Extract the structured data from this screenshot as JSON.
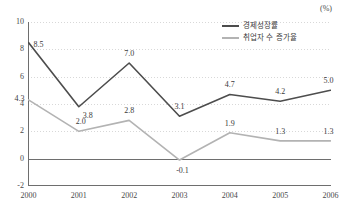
{
  "unit_label": "(%)",
  "legend": {
    "position": "top-right",
    "items": [
      {
        "label": "경제성장률",
        "color": "#4d4d4d"
      },
      {
        "label": "취업자 수 증가율",
        "color": "#b3b3b3"
      }
    ]
  },
  "chart_data": {
    "type": "line",
    "title": "",
    "subtitle": "",
    "xlabel": "",
    "ylabel": "",
    "unit": "(%)",
    "categories": [
      "2000",
      "2001",
      "2002",
      "2003",
      "2004",
      "2005",
      "2006"
    ],
    "x": [
      2000,
      2001,
      2002,
      2003,
      2004,
      2005,
      2006
    ],
    "ylim": [
      -2,
      10
    ],
    "yticks": [
      -2,
      0,
      2,
      4,
      6,
      8,
      10
    ],
    "ytick_labels": [
      "-2",
      "0",
      "2",
      "4",
      "6",
      "8",
      "10"
    ],
    "grid": true,
    "grid_style": "dotted-horizontal",
    "zero_line": true,
    "legend_position": "top-right",
    "series": [
      {
        "name": "경제성장률",
        "color": "#4d4d4d",
        "values": [
          8.5,
          3.8,
          7.0,
          3.1,
          4.7,
          4.2,
          5.0
        ],
        "labels": [
          "8.5",
          "3.8",
          "7.0",
          "3.1",
          "4.7",
          "4.2",
          "5.0"
        ]
      },
      {
        "name": "취업자 수 증가율",
        "color": "#b3b3b3",
        "values": [
          4.3,
          2.0,
          2.8,
          -0.1,
          1.9,
          1.3,
          1.3
        ],
        "labels": [
          "4.3",
          "2.0",
          "2.8",
          "-0.1",
          "1.9",
          "1.3",
          "1.3"
        ]
      }
    ]
  },
  "colors": {
    "series_dark": "#4d4d4d",
    "series_light": "#b3b3b3",
    "axis": "#6e6e6e",
    "grid": "#d8d8d8",
    "text": "#3a3a3a",
    "background": "#ffffff"
  }
}
